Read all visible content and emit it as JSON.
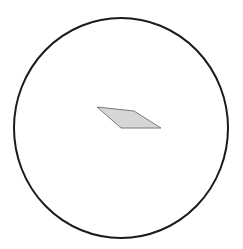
{
  "diagram": {
    "background": "#ffffff",
    "circle": {
      "cx": 121,
      "cy": 128,
      "rx": 107,
      "ry": 110,
      "stroke": "#1a1a1a",
      "stroke_width": 2,
      "fill": "none"
    },
    "parallelogram": {
      "points": "97,107 134,111 161,128 121,128",
      "fill": "#d6d6d6",
      "stroke": "#7a7a7a",
      "stroke_width": 1
    }
  }
}
